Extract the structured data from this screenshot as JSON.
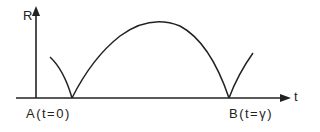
{
  "diagram": {
    "y_axis_label": "R",
    "x_axis_label": "t",
    "point_a_label": "A(t=0)",
    "point_b_label": "B(t=γ)",
    "stroke_color": "#222222"
  }
}
